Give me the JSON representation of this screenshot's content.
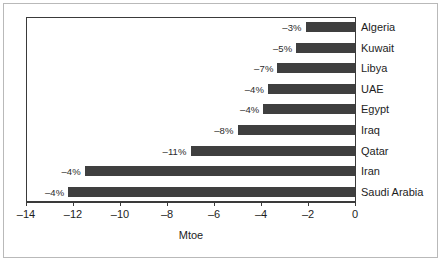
{
  "chart_data": {
    "type": "bar",
    "orientation": "horizontal",
    "title": "",
    "xlabel": "Mtoe",
    "ylabel": "",
    "xlim": [
      -14,
      0
    ],
    "xticks": [
      -14,
      -12,
      -10,
      -8,
      -6,
      -4,
      -2,
      0
    ],
    "xticklabels": [
      "–14",
      "–12",
      "–10",
      "–8",
      "–6",
      "–4",
      "–2",
      "0"
    ],
    "grid": false,
    "legend": false,
    "bar_color": "#3f3f3f",
    "categories": [
      "Algeria",
      "Kuwait",
      "Libya",
      "UAE",
      "Egypt",
      "Iraq",
      "Qatar",
      "Iran",
      "Saudi Arabia"
    ],
    "values": [
      -2.1,
      -2.5,
      -3.3,
      -3.7,
      -3.9,
      -5.0,
      -7.0,
      -11.5,
      -12.2
    ],
    "data_labels": [
      "–3%",
      "–5%",
      "–7%",
      "–4%",
      "–4%",
      "–8%",
      "–11%",
      "–4%",
      "–4%"
    ],
    "bars": [
      {
        "category": "Algeria",
        "value": -2.1,
        "label": "–3%"
      },
      {
        "category": "Kuwait",
        "value": -2.5,
        "label": "–5%"
      },
      {
        "category": "Libya",
        "value": -3.3,
        "label": "–7%"
      },
      {
        "category": "UAE",
        "value": -3.7,
        "label": "–4%"
      },
      {
        "category": "Egypt",
        "value": -3.9,
        "label": "–4%"
      },
      {
        "category": "Iraq",
        "value": -5.0,
        "label": "–8%"
      },
      {
        "category": "Qatar",
        "value": -7.0,
        "label": "–11%"
      },
      {
        "category": "Iran",
        "value": -11.5,
        "label": "–4%"
      },
      {
        "category": "Saudi Arabia",
        "value": -12.2,
        "label": "–4%"
      }
    ]
  }
}
